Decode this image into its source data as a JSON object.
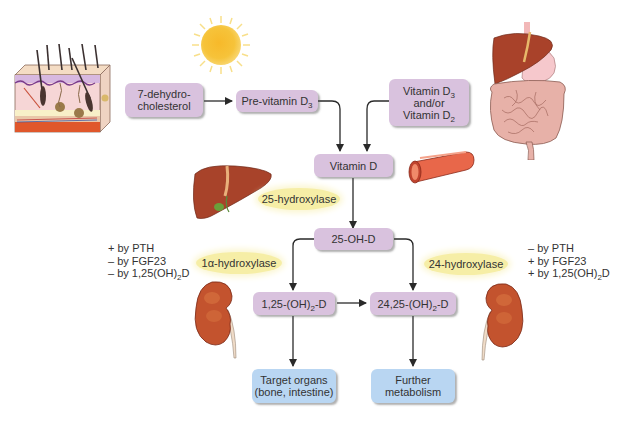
{
  "diagram": {
    "nodes": {
      "dehydrocholesterol": {
        "line1": "7-dehydro-",
        "line2": "cholesterol"
      },
      "previtamin": {
        "text": "Pre-vitamin D",
        "sub": "3"
      },
      "dietary": {
        "line1": "Vitamin D",
        "sub1": "3",
        "line2": "and/or",
        "line3": "Vitamin D",
        "sub3": "2"
      },
      "vitamin_d": {
        "text": "Vitamin D"
      },
      "oh_d": {
        "text": "25-OH-D"
      },
      "calcitriol": {
        "pre": "1,25-(OH)",
        "sub": "2",
        "post": "-D"
      },
      "inactive": {
        "pre": "24,25-(OH)",
        "sub": "2",
        "post": "-D"
      },
      "target": {
        "line1": "Target organs",
        "line2": "(bone, intestine)"
      },
      "further": {
        "line1": "Further",
        "line2": "metabolism"
      }
    },
    "enzymes": {
      "e25": "25-hydroxylase",
      "e1a": "1α-hydroxylase",
      "e24": "24-hydroxylase"
    },
    "regulation_left": {
      "l1": "+ by PTH",
      "l2": "– by FGF23",
      "l3pre": "– by 1,25(OH)",
      "l3sub": "2",
      "l3post": "D"
    },
    "regulation_right": {
      "l1": "– by PTH",
      "l2": "+ by FGF23",
      "l3pre": "+ by 1,25(OH)",
      "l3sub": "2",
      "l3post": "D"
    },
    "illustrations": [
      "skin-icon",
      "sun-icon",
      "digestive-tract-icon",
      "blood-vessel-icon",
      "liver-icon",
      "kidney-icon-left",
      "kidney-icon-right"
    ],
    "colors": {
      "node_purple": "#d9c2de",
      "node_blue": "#b9d6f2",
      "enzyme_yellow": "#f6eea6",
      "arrow": "#2a2a2a"
    }
  }
}
